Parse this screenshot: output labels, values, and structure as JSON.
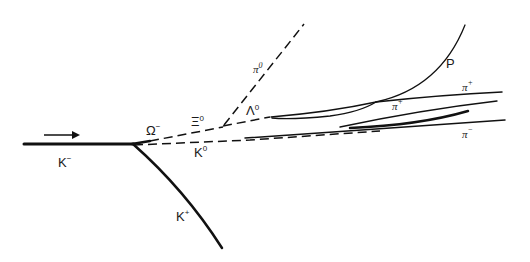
{
  "diagram": {
    "beam_direction": "right",
    "particles": [
      {
        "id": "k_minus",
        "symbol": "K",
        "charge": "−",
        "track": "solid",
        "role": "incoming beam"
      },
      {
        "id": "k_plus",
        "symbol": "K",
        "charge": "+",
        "track": "solid"
      },
      {
        "id": "k_zero",
        "symbol": "K",
        "charge": "0",
        "track": "dashed"
      },
      {
        "id": "omega_minus",
        "symbol": "Ω",
        "charge": "−",
        "track": "solid-short"
      },
      {
        "id": "xi_zero",
        "symbol": "Ξ",
        "charge": "0",
        "track": "dashed"
      },
      {
        "id": "lambda_zero",
        "symbol": "Λ",
        "charge": "0",
        "track": "dashed"
      },
      {
        "id": "pi_zero",
        "symbol": "π",
        "charge": "0",
        "track": "dashed"
      },
      {
        "id": "proton",
        "symbol": "P",
        "charge": "",
        "track": "solid"
      },
      {
        "id": "pi_plus_1",
        "symbol": "π",
        "charge": "+",
        "track": "solid"
      },
      {
        "id": "pi_plus_2",
        "symbol": "π",
        "charge": "+",
        "track": "solid"
      },
      {
        "id": "pi_minus",
        "symbol": "π",
        "charge": "−",
        "track": "solid"
      }
    ],
    "labels": {
      "k_minus": {
        "base": "K",
        "sup": "−"
      },
      "k_plus": {
        "base": "K",
        "sup": "+"
      },
      "k_zero": {
        "base": "K",
        "sup": "0"
      },
      "omega_minus": {
        "base": "Ω",
        "sup": "−"
      },
      "xi_zero": {
        "base": "Ξ",
        "sup": "0"
      },
      "lambda_zero": {
        "base": "Λ",
        "sup": "0"
      },
      "pi_zero": {
        "base": "π",
        "sup": "0"
      },
      "proton": {
        "base": "P",
        "sup": ""
      },
      "pi_plus_1": {
        "base": "π",
        "sup": "+"
      },
      "pi_plus_2": {
        "base": "π",
        "sup": "+"
      },
      "pi_minus": {
        "base": "π",
        "sup": "−"
      }
    }
  }
}
